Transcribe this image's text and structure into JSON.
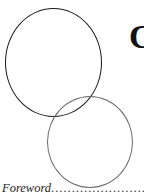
{
  "page": {
    "heading_partial": "C",
    "decoration": {
      "circles": [
        {
          "name": "black-circle",
          "color": "#1a1a1a"
        },
        {
          "name": "gray-circle",
          "color": "#6b6b6b"
        }
      ]
    },
    "toc": {
      "entries": [
        {
          "label": "Foreword",
          "leader": "................................................"
        }
      ]
    }
  }
}
